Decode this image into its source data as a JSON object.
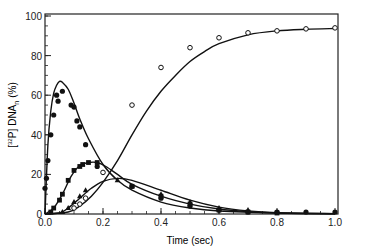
{
  "chart_data": {
    "type": "scatter",
    "title": "",
    "xlabel": "Time (sec)",
    "ylabel": "[32P] DNAn (%)",
    "ylabel_parts": {
      "bracket_open": "[",
      "sup": "32",
      "p": "P",
      "bracket_close": "]",
      "main": "DNA",
      "sub": "n",
      "unit": "(%)"
    },
    "xlim": [
      0.0,
      1.0
    ],
    "ylim": [
      0,
      100
    ],
    "x_ticks": [
      "0.0",
      "0.2",
      "0.4",
      "0.6",
      "0.8",
      "1.0"
    ],
    "y_ticks": [
      "0",
      "20",
      "40",
      "60",
      "80",
      "100"
    ],
    "grid": false,
    "legend": "none",
    "series": [
      {
        "name": "DNA species 1 (filled circles, fast peak)",
        "marker": "filled-circle",
        "points": [
          [
            0.0,
            13
          ],
          [
            0.005,
            18
          ],
          [
            0.01,
            27
          ],
          [
            0.02,
            40
          ],
          [
            0.03,
            50
          ],
          [
            0.04,
            60
          ],
          [
            0.045,
            57
          ],
          [
            0.06,
            62
          ],
          [
            0.09,
            55
          ],
          [
            0.1,
            54
          ],
          [
            0.11,
            47
          ],
          [
            0.12,
            44
          ],
          [
            0.14,
            35
          ],
          [
            0.18,
            24
          ],
          [
            0.3,
            14
          ],
          [
            0.4,
            8
          ],
          [
            0.5,
            4
          ],
          [
            0.6,
            2
          ],
          [
            0.7,
            1
          ],
          [
            0.8,
            1
          ],
          [
            0.9,
            1
          ],
          [
            1.0,
            1
          ]
        ],
        "curve": [
          [
            0,
            0
          ],
          [
            0.01,
            35
          ],
          [
            0.02,
            52
          ],
          [
            0.03,
            61
          ],
          [
            0.04,
            65
          ],
          [
            0.05,
            67
          ],
          [
            0.06,
            66.5
          ],
          [
            0.08,
            63
          ],
          [
            0.1,
            56
          ],
          [
            0.12,
            48
          ],
          [
            0.15,
            38
          ],
          [
            0.2,
            25
          ],
          [
            0.25,
            17
          ],
          [
            0.3,
            12
          ],
          [
            0.4,
            6
          ],
          [
            0.5,
            3
          ],
          [
            0.6,
            1.5
          ],
          [
            0.8,
            0.5
          ],
          [
            1.0,
            0.2
          ]
        ]
      },
      {
        "name": "DNA species 2 (filled squares)",
        "marker": "filled-square",
        "points": [
          [
            0.02,
            1
          ],
          [
            0.03,
            3
          ],
          [
            0.05,
            7
          ],
          [
            0.06,
            10
          ],
          [
            0.08,
            17
          ],
          [
            0.1,
            22
          ],
          [
            0.12,
            24
          ],
          [
            0.13,
            25
          ],
          [
            0.15,
            26
          ],
          [
            0.18,
            26
          ],
          [
            0.3,
            14
          ],
          [
            0.4,
            9
          ],
          [
            0.5,
            5
          ],
          [
            0.6,
            2
          ],
          [
            0.7,
            1
          ],
          [
            0.8,
            0.5
          ]
        ],
        "curve": [
          [
            0,
            0
          ],
          [
            0.03,
            3
          ],
          [
            0.06,
            10
          ],
          [
            0.09,
            19
          ],
          [
            0.12,
            24.5
          ],
          [
            0.15,
            26
          ],
          [
            0.18,
            26
          ],
          [
            0.21,
            24
          ],
          [
            0.25,
            20
          ],
          [
            0.3,
            15
          ],
          [
            0.4,
            9
          ],
          [
            0.5,
            5
          ],
          [
            0.6,
            2.5
          ],
          [
            0.7,
            1.2
          ],
          [
            0.8,
            0.5
          ],
          [
            1.0,
            0.1
          ]
        ]
      },
      {
        "name": "DNA species 3 (filled triangles)",
        "marker": "filled-triangle",
        "points": [
          [
            0.06,
            1
          ],
          [
            0.08,
            3
          ],
          [
            0.1,
            6
          ],
          [
            0.12,
            9
          ],
          [
            0.14,
            12
          ],
          [
            0.25,
            17
          ],
          [
            0.3,
            14
          ],
          [
            0.4,
            10
          ],
          [
            0.5,
            6
          ],
          [
            0.6,
            3
          ],
          [
            0.7,
            2
          ],
          [
            0.8,
            1
          ]
        ],
        "curve": [
          [
            0,
            0
          ],
          [
            0.05,
            0.5
          ],
          [
            0.08,
            3
          ],
          [
            0.12,
            8
          ],
          [
            0.16,
            13
          ],
          [
            0.2,
            16.5
          ],
          [
            0.25,
            18
          ],
          [
            0.3,
            17
          ],
          [
            0.4,
            12
          ],
          [
            0.5,
            7
          ],
          [
            0.6,
            3.5
          ],
          [
            0.7,
            1.6
          ],
          [
            0.8,
            0.7
          ],
          [
            1.0,
            0.1
          ]
        ]
      },
      {
        "name": "DNA species 4 (open circles, accumulating product)",
        "marker": "open-circle",
        "points": [
          [
            0.1,
            3
          ],
          [
            0.12,
            5
          ],
          [
            0.14,
            8
          ],
          [
            0.2,
            21
          ],
          [
            0.3,
            55
          ],
          [
            0.4,
            74
          ],
          [
            0.5,
            84
          ],
          [
            0.6,
            89
          ],
          [
            0.7,
            91.5
          ],
          [
            0.8,
            92.5
          ],
          [
            0.9,
            93.5
          ],
          [
            1.0,
            94
          ]
        ],
        "curve": [
          [
            0,
            0
          ],
          [
            0.08,
            1
          ],
          [
            0.12,
            4
          ],
          [
            0.16,
            9
          ],
          [
            0.2,
            16
          ],
          [
            0.25,
            27
          ],
          [
            0.3,
            40
          ],
          [
            0.35,
            52
          ],
          [
            0.4,
            62
          ],
          [
            0.45,
            70
          ],
          [
            0.5,
            77
          ],
          [
            0.55,
            82
          ],
          [
            0.6,
            86
          ],
          [
            0.7,
            90.5
          ],
          [
            0.8,
            92.5
          ],
          [
            0.9,
            93.3
          ],
          [
            1.0,
            93.7
          ]
        ]
      }
    ]
  }
}
